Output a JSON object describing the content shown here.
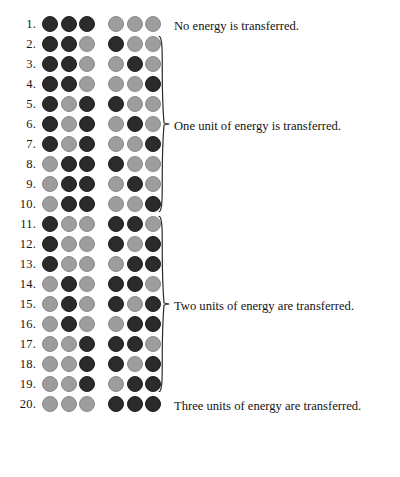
{
  "figure": {
    "colors": {
      "dark_dot": "#2b2b2b",
      "light_dot": "#9d9d9d",
      "text": "#141414",
      "background": "#ffffff"
    },
    "dot_states": {
      "dark": "occupied-unit",
      "light": "empty-unit"
    }
  },
  "rows": [
    {
      "number": "1.",
      "left": [
        "dark",
        "dark",
        "dark"
      ],
      "right": [
        "light",
        "light",
        "light"
      ]
    },
    {
      "number": "2.",
      "left": [
        "dark",
        "dark",
        "light"
      ],
      "right": [
        "dark",
        "light",
        "light"
      ]
    },
    {
      "number": "3.",
      "left": [
        "dark",
        "dark",
        "light"
      ],
      "right": [
        "light",
        "dark",
        "light"
      ]
    },
    {
      "number": "4.",
      "left": [
        "dark",
        "dark",
        "light"
      ],
      "right": [
        "light",
        "light",
        "dark"
      ]
    },
    {
      "number": "5.",
      "left": [
        "dark",
        "light",
        "dark"
      ],
      "right": [
        "dark",
        "light",
        "light"
      ]
    },
    {
      "number": "6.",
      "left": [
        "dark",
        "light",
        "dark"
      ],
      "right": [
        "light",
        "dark",
        "light"
      ]
    },
    {
      "number": "7.",
      "left": [
        "dark",
        "light",
        "dark"
      ],
      "right": [
        "light",
        "light",
        "dark"
      ]
    },
    {
      "number": "8.",
      "left": [
        "light",
        "dark",
        "dark"
      ],
      "right": [
        "dark",
        "light",
        "light"
      ]
    },
    {
      "number": "9.",
      "left": [
        "light",
        "dark",
        "dark"
      ],
      "right": [
        "light",
        "dark",
        "light"
      ]
    },
    {
      "number": "10.",
      "left": [
        "light",
        "dark",
        "dark"
      ],
      "right": [
        "light",
        "light",
        "dark"
      ]
    },
    {
      "number": "11.",
      "left": [
        "dark",
        "light",
        "light"
      ],
      "right": [
        "dark",
        "dark",
        "light"
      ]
    },
    {
      "number": "12.",
      "left": [
        "dark",
        "light",
        "light"
      ],
      "right": [
        "dark",
        "light",
        "dark"
      ]
    },
    {
      "number": "13.",
      "left": [
        "dark",
        "light",
        "light"
      ],
      "right": [
        "light",
        "dark",
        "dark"
      ]
    },
    {
      "number": "14.",
      "left": [
        "light",
        "dark",
        "light"
      ],
      "right": [
        "dark",
        "dark",
        "light"
      ]
    },
    {
      "number": "15.",
      "left": [
        "light",
        "dark",
        "light"
      ],
      "right": [
        "dark",
        "light",
        "dark"
      ]
    },
    {
      "number": "16.",
      "left": [
        "light",
        "dark",
        "light"
      ],
      "right": [
        "light",
        "dark",
        "dark"
      ]
    },
    {
      "number": "17.",
      "left": [
        "light",
        "light",
        "dark"
      ],
      "right": [
        "dark",
        "dark",
        "light"
      ]
    },
    {
      "number": "18.",
      "left": [
        "light",
        "light",
        "dark"
      ],
      "right": [
        "dark",
        "light",
        "dark"
      ]
    },
    {
      "number": "19.",
      "left": [
        "light",
        "light",
        "dark"
      ],
      "right": [
        "light",
        "dark",
        "dark"
      ]
    },
    {
      "number": "20.",
      "left": [
        "light",
        "light",
        "light"
      ],
      "right": [
        "dark",
        "dark",
        "dark"
      ]
    }
  ],
  "captions": [
    {
      "text": "No energy is transferred.",
      "row_index": 0
    },
    {
      "text": "One unit of energy is transferred.",
      "row_index": 5
    },
    {
      "text": "Two units of energy are transferred.",
      "row_index": 14
    },
    {
      "text": "Three units of energy are transferred.",
      "row_index": 19
    }
  ],
  "braces": [
    {
      "label": "brace-rows-2-10",
      "from_row": 2,
      "to_row": 10
    },
    {
      "label": "brace-rows-11-19",
      "from_row": 11,
      "to_row": 19
    }
  ]
}
